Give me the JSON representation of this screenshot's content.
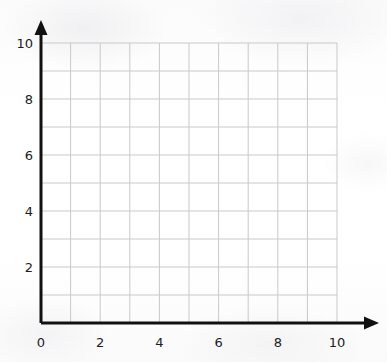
{
  "figure": {
    "kind": "blank-coordinate-grid",
    "background_color": "#fdfdfd",
    "axis_color": "#111111",
    "grid_color": "#c9c9c9",
    "label_color": "#1c1c1c",
    "axis_line_width": 3,
    "grid_line_width": 1,
    "arrowhead": "solid-triangle"
  },
  "chart_data": {
    "type": "scatter",
    "title": "",
    "subtitle": "",
    "xlabel": "",
    "ylabel": "",
    "xlim": [
      0,
      10
    ],
    "ylim": [
      0,
      10
    ],
    "xticks": [
      0,
      2,
      4,
      6,
      8,
      10
    ],
    "yticks": [
      0,
      2,
      4,
      6,
      8,
      10
    ],
    "xtick_labels": [
      "0",
      "2",
      "4",
      "6",
      "8",
      "10"
    ],
    "ytick_labels": [
      "0",
      "2",
      "4",
      "6",
      "8",
      "10"
    ],
    "minor_grid_step": 1,
    "grid": true,
    "legend": null,
    "legend_position": "none",
    "annotations": [],
    "series": [],
    "x": [],
    "values": []
  },
  "geometry": {
    "origin_x_px": 41,
    "origin_y_px": 323,
    "unit_px_x": 29.6,
    "unit_px_y": 28.0,
    "grid_right_px": 337,
    "grid_top_px": 43,
    "x_axis_arrow_tip_px": 379,
    "y_axis_arrow_tip_px": 20
  },
  "axes": {
    "x_axis_name": "x-axis",
    "y_axis_name": "y-axis"
  }
}
